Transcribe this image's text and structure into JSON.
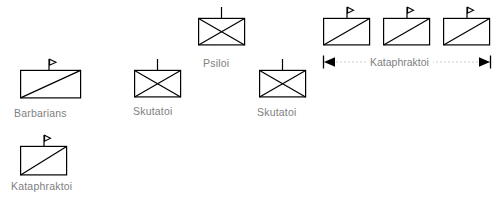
{
  "diagram": {
    "background_color": "#ffffff",
    "symbol_stroke_color": "#000000",
    "label_color": "#808080"
  },
  "units": [
    {
      "id": "unit-barbarians",
      "symbol": "diagonal-line-box-with-flag",
      "label": "Barbarians",
      "x": 20,
      "y": 70,
      "w": 60,
      "h": 28,
      "label_x": 14,
      "label_y": 107
    },
    {
      "id": "unit-kataphraktoi-left",
      "symbol": "diagonal-line-box-with-flag",
      "label": "Kataphraktoi",
      "x": 20,
      "y": 146,
      "w": 46,
      "h": 29,
      "label_x": 11,
      "label_y": 180
    },
    {
      "id": "unit-skutatoi-left",
      "symbol": "crossed-box-with-staff",
      "label": "Skutatoi",
      "x": 134,
      "y": 70,
      "w": 47,
      "h": 27,
      "label_x": 133,
      "label_y": 105
    },
    {
      "id": "unit-psiloi",
      "symbol": "crossed-box-with-staff",
      "label": "Psiloi",
      "x": 198,
      "y": 18,
      "w": 47,
      "h": 27,
      "label_x": 203,
      "label_y": 57
    },
    {
      "id": "unit-skutatoi-right",
      "symbol": "crossed-box-with-staff",
      "label": "Skutatoi",
      "x": 259,
      "y": 70,
      "w": 47,
      "h": 27,
      "label_x": 257,
      "label_y": 106
    },
    {
      "id": "unit-kataphraktoi-1",
      "symbol": "diagonal-line-box-with-flag",
      "label": "",
      "x": 323,
      "y": 18,
      "w": 47,
      "h": 27,
      "label_x": 0,
      "label_y": 0
    },
    {
      "id": "unit-kataphraktoi-2",
      "symbol": "diagonal-line-box-with-flag",
      "label": "",
      "x": 383,
      "y": 18,
      "w": 47,
      "h": 27,
      "label_x": 0,
      "label_y": 0
    },
    {
      "id": "unit-kataphraktoi-3",
      "symbol": "diagonal-line-box-with-flag",
      "label": "",
      "x": 443,
      "y": 18,
      "w": 47,
      "h": 27,
      "label_x": 0,
      "label_y": 0
    }
  ],
  "bracket": {
    "label": "Kataphraktoi",
    "x": 321,
    "y": 56,
    "width": 170,
    "label_x": 371,
    "label_y": 56,
    "left_arrow": "arrow-left",
    "right_arrow": "arrow-right"
  }
}
